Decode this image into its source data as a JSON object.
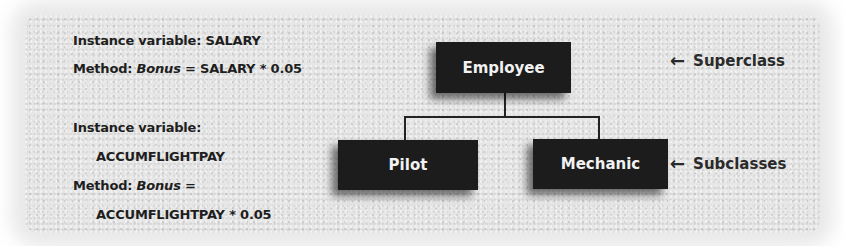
{
  "left_notes": {
    "superclass": {
      "line1": "Instance variable: SALARY",
      "method_prefix": "Method: ",
      "method_name": "Bonus",
      "method_expr": " = SALARY * 0.05"
    },
    "subclass": {
      "line1": "Instance variable:",
      "line2": "ACCUMFLIGHTPAY",
      "method_prefix": "Method: ",
      "method_name": "Bonus",
      "method_expr": " =",
      "line4": "ACCUMFLIGHTPAY * 0.05"
    }
  },
  "diagram": {
    "superclass_box": "Employee",
    "subclass_boxes": [
      "Pilot",
      "Mechanic"
    ]
  },
  "annotations": {
    "superclass_label": "Superclass",
    "subclasses_label": "Subclasses",
    "arrow_glyph": "←"
  }
}
